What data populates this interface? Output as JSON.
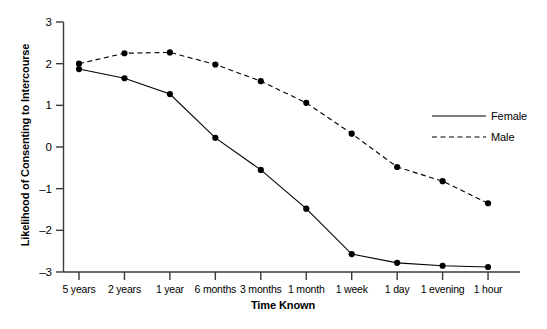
{
  "chart_data": {
    "type": "line",
    "title": "",
    "xlabel": "Time Known",
    "ylabel": "Likelihood of Consenting to Intercourse",
    "categories": [
      "5 years",
      "2 years",
      "1 year",
      "6 months",
      "3 months",
      "1 month",
      "1 week",
      "1 day",
      "1 evening",
      "1 hour"
    ],
    "ylim": [
      -3,
      3
    ],
    "yticks": [
      3,
      2,
      1,
      0,
      -1,
      -2,
      -3
    ],
    "ytick_labels": [
      "3",
      "2",
      "1",
      "0",
      "–1",
      "–2",
      "–3"
    ],
    "grid": false,
    "legend_position": "right-middle",
    "series": [
      {
        "name": "Female",
        "style": "solid",
        "marker": "filled-circle",
        "color": "#000000",
        "values": [
          1.87,
          1.65,
          1.27,
          0.22,
          -0.55,
          -1.48,
          -2.57,
          -2.78,
          -2.85,
          -2.88
        ]
      },
      {
        "name": "Male",
        "style": "dashed",
        "marker": "filled-circle",
        "color": "#000000",
        "values": [
          2.0,
          2.25,
          2.27,
          1.98,
          1.58,
          1.06,
          0.32,
          -0.48,
          -0.82,
          -1.35
        ]
      }
    ]
  },
  "legend": {
    "items": [
      {
        "label": "Female",
        "style": "solid"
      },
      {
        "label": "Male",
        "style": "dashed"
      }
    ]
  }
}
